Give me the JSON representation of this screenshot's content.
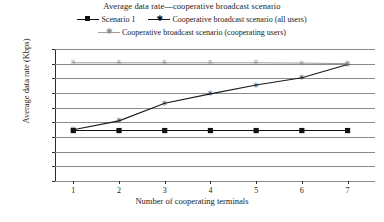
{
  "chart_data": {
    "type": "line",
    "title": "Average data rate—cooperative broadcast scenario",
    "xlabel": "Number of cooperating terminals",
    "ylabel": "Average data rate (Kbps)",
    "x": [
      1,
      2,
      3,
      4,
      5,
      6,
      7
    ],
    "xlim": [
      0.6,
      7.6
    ],
    "ylim": [
      0,
      450
    ],
    "yticks": [
      0,
      50,
      100,
      150,
      200,
      250,
      300,
      350,
      400,
      450
    ],
    "xticks": [
      1,
      2,
      3,
      4,
      5,
      6,
      7
    ],
    "grid": "horizontal",
    "legend_position": "top-center",
    "series": [
      {
        "name": "Scenario 1",
        "values": [
          172,
          172,
          172,
          172,
          172,
          172,
          172
        ],
        "color": "#101010",
        "marker": "square"
      },
      {
        "name": "Cooperative broadcast scenario (all users)",
        "values": [
          175,
          205,
          265,
          297,
          327,
          352,
          397
        ],
        "color": "#1a1a1a",
        "marker": "star"
      },
      {
        "name": "Cooperative broadcast scenario (cooperating users)",
        "values": [
          403,
          403,
          403,
          403,
          403,
          402,
          400
        ],
        "color": "#8d8d8d",
        "marker": "star"
      }
    ]
  },
  "legend": {
    "items": [
      {
        "label": "Scenario 1",
        "marker": "square-marker-icon"
      },
      {
        "label": "Cooperative broadcast scenario (all users)",
        "marker": "star-marker-icon"
      },
      {
        "label": "Cooperative broadcast scenario (cooperating users)",
        "marker": "star-marker-grey-icon"
      }
    ]
  }
}
